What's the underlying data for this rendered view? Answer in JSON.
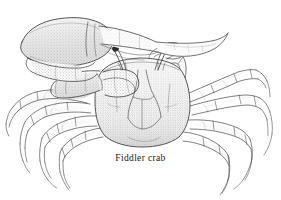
{
  "figure": {
    "caption": "Fiddler crab",
    "medium": "pen-and-ink stipple line illustration",
    "background_color": "#ffffff",
    "ink_color": "#3a3a3a",
    "stipple_fill_color": "#e9e9e9",
    "eye_color": "#2b2b2b"
  },
  "anatomy": {
    "major_claw": {
      "label": "major cheliped (enlarged left claw)",
      "side": "left",
      "texture": "stippled"
    },
    "minor_claw": {
      "label": "minor cheliped",
      "side": "right",
      "texture": "outline"
    },
    "carapace": {
      "label": "carapace",
      "texture": "stippled with contour furrows"
    },
    "eyestalks": {
      "label": "eyestalks",
      "count": 2
    },
    "walking_legs": {
      "label": "walking legs (pereiopods)",
      "count_left": 4,
      "count_right": 4
    }
  }
}
